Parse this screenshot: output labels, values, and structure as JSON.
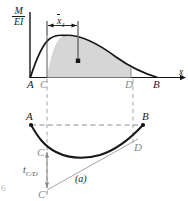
{
  "figure": {
    "caption": "(a)",
    "page_marker": "6",
    "axes": {
      "y_axis_label_numerator": "M",
      "y_axis_label_denominator": "EI",
      "x_axis_label": "x"
    },
    "dimension": {
      "label_symbol": "x",
      "label_subscript": "1",
      "description": "centroid distance x-bar-1 from C to centroid of shaded area"
    },
    "deviation": {
      "label_symbol": "t",
      "label_subscript": "C/D",
      "description": "tangential deviation of C with respect to tangent at D"
    },
    "top_diagram": {
      "name": "M/EI diagram",
      "points": [
        {
          "label": "A",
          "x": 30,
          "y": 84
        },
        {
          "label": "C",
          "x": 43,
          "y": 84
        },
        {
          "label": "D",
          "x": 128,
          "y": 84
        },
        {
          "label": "B",
          "x": 156,
          "y": 84
        }
      ],
      "shaded_region_color": "#d6d6d6",
      "curve_color": "#161616",
      "centroid_marker": {
        "x": 78,
        "y": 61
      }
    },
    "bottom_diagram": {
      "name": "elastic curve",
      "points": [
        {
          "label": "A",
          "x": 30,
          "y": 116
        },
        {
          "label": "B",
          "x": 147,
          "y": 116
        },
        {
          "label": "C",
          "x": 40,
          "y": 150
        },
        {
          "label": "D",
          "x": 137,
          "y": 146
        },
        {
          "label": "C'",
          "x": 41,
          "y": 192
        }
      ],
      "chord_color": "#8e8e8e",
      "tangent_line_color": "#9a9a9a"
    },
    "colors": {
      "ink": "#161616",
      "faint_ink": "#8a8a8a",
      "shade": "#d6d6d6",
      "dashed": "#a6a6a6"
    }
  }
}
